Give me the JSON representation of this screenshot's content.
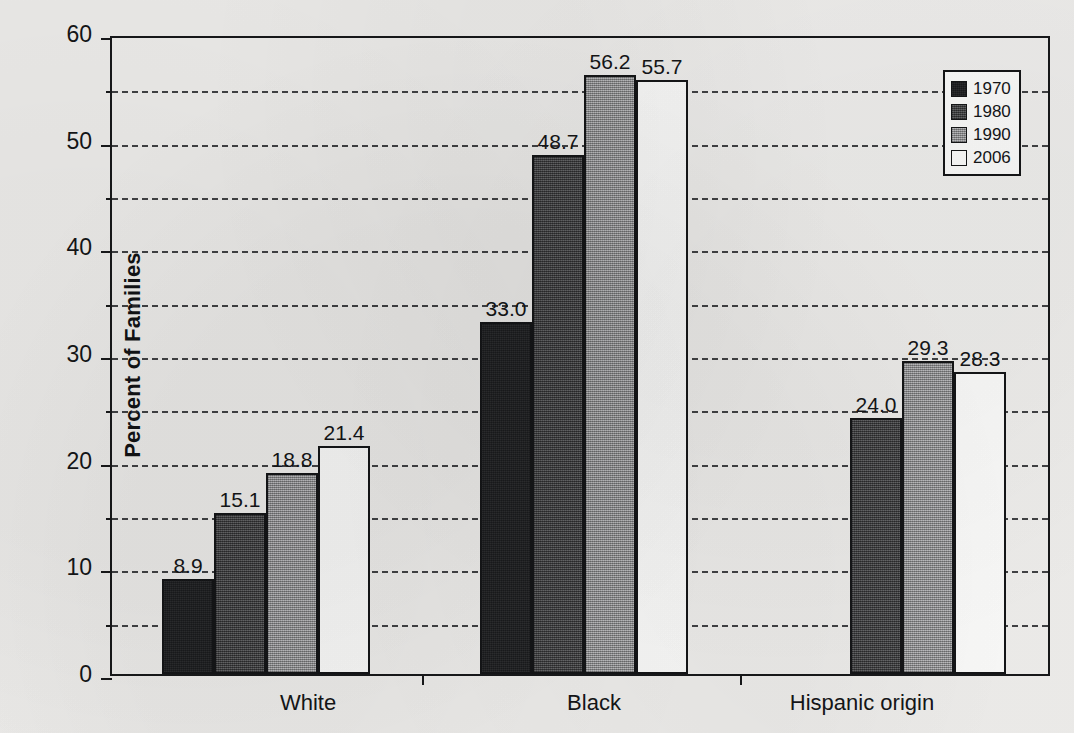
{
  "chart_data": {
    "type": "bar",
    "title": "",
    "subtitle": "",
    "xlabel": "",
    "ylabel": "Percent of Families",
    "categories": [
      "White",
      "Black",
      "Hispanic origin"
    ],
    "series": [
      {
        "name": "1970",
        "color": "#18191b",
        "values": [
          8.9,
          33.0,
          null
        ],
        "labels": [
          "8.9",
          "33.0",
          ""
        ]
      },
      {
        "name": "1980",
        "color": "#4a4b4d",
        "values": [
          15.1,
          48.7,
          24.0
        ],
        "labels": [
          "15.1",
          "48.7",
          "24.0"
        ]
      },
      {
        "name": "1990",
        "color": "#9c9d9f",
        "values": [
          18.8,
          56.2,
          29.3
        ],
        "labels": [
          "18.8",
          "56.2",
          "29.3"
        ]
      },
      {
        "name": "2006",
        "color": "#fbfbfa",
        "values": [
          21.4,
          55.7,
          28.3
        ],
        "labels": [
          "21.4",
          "55.7",
          "28.3"
        ]
      }
    ],
    "ylim": [
      0,
      60
    ],
    "ytick_labels": [
      "0",
      "10",
      "20",
      "30",
      "40",
      "50",
      "60"
    ],
    "ytick_values": [
      0,
      10,
      20,
      30,
      40,
      50,
      60
    ],
    "gridline_values": [
      5,
      10,
      15,
      20,
      25,
      30,
      35,
      40,
      45,
      50,
      55
    ],
    "grid": true,
    "grid_style": "dashed",
    "legend_position": "top-right",
    "legend_entries": [
      "1970",
      "1980",
      "1990",
      "2006"
    ],
    "value_labels_shown": true,
    "bar_outline_color": "#141517",
    "axis_color": "#17181a",
    "background_color": "#efeeec"
  }
}
